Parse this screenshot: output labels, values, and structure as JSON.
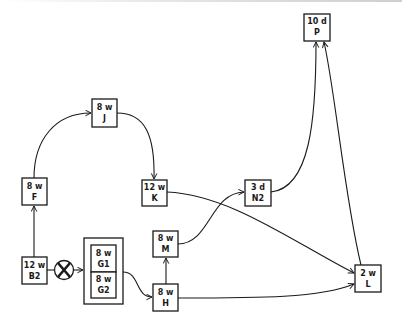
{
  "diagram": {
    "type": "flow-graph",
    "nodes": [
      {
        "id": "P",
        "duration": "10 d",
        "name": "P"
      },
      {
        "id": "J",
        "duration": "8 w",
        "name": "J"
      },
      {
        "id": "F",
        "duration": "8 w",
        "name": "F"
      },
      {
        "id": "K",
        "duration": "12 w",
        "name": "K"
      },
      {
        "id": "N2",
        "duration": "3 d",
        "name": "N2"
      },
      {
        "id": "M",
        "duration": "8 w",
        "name": "M"
      },
      {
        "id": "B2",
        "duration": "12 w",
        "name": "B2"
      },
      {
        "id": "G1",
        "duration": "8 w",
        "name": "G1"
      },
      {
        "id": "G2",
        "duration": "8 w",
        "name": "G2"
      },
      {
        "id": "H",
        "duration": "8 w",
        "name": "H"
      },
      {
        "id": "L",
        "duration": "2 w",
        "name": "L"
      }
    ],
    "group": {
      "id": "G",
      "members": [
        "G1",
        "G2"
      ]
    },
    "junction": {
      "id": "X",
      "symbol": "X",
      "type": "blocked-junction"
    },
    "edges": [
      {
        "from": "B2",
        "to": "F"
      },
      {
        "from": "F",
        "to": "J"
      },
      {
        "from": "J",
        "to": "K"
      },
      {
        "from": "K",
        "to": "L"
      },
      {
        "from": "B2",
        "to": "X"
      },
      {
        "from": "X",
        "to": "G"
      },
      {
        "from": "G",
        "to": "H"
      },
      {
        "from": "H",
        "to": "M"
      },
      {
        "from": "H",
        "to": "L"
      },
      {
        "from": "M",
        "to": "N2"
      },
      {
        "from": "N2",
        "to": "P"
      },
      {
        "from": "L",
        "to": "P"
      }
    ]
  }
}
